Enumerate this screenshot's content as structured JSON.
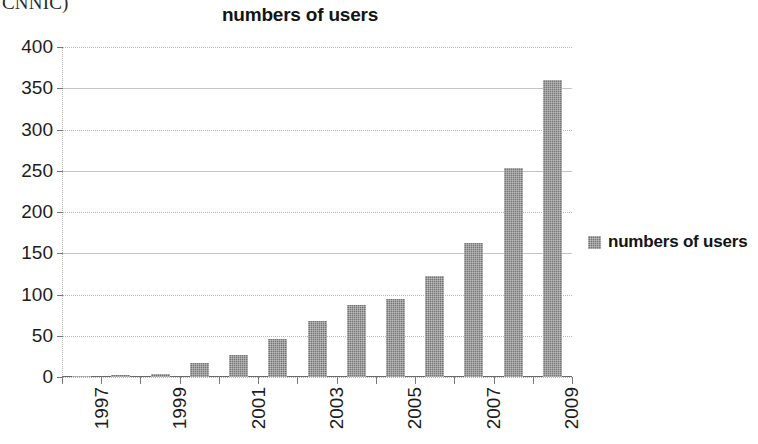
{
  "top_fragment": "CNNIC)",
  "legend": {
    "position": "right",
    "entries": [
      "numbers of users"
    ]
  },
  "colors": {
    "bar": "#757575",
    "gridline": "#b9b9b9",
    "axis": "#6a6a6a",
    "text": "#1d1d1d",
    "background": "#ffffff"
  },
  "chart_data": {
    "type": "bar",
    "title": "numbers of users",
    "xlabel": "",
    "ylabel": "",
    "ylim": [
      0,
      400
    ],
    "yticks": [
      0,
      50,
      100,
      150,
      200,
      250,
      300,
      350,
      400
    ],
    "ytick_labels": [
      "0",
      "50",
      "100",
      "150",
      "200",
      "250",
      "300",
      "350",
      "400"
    ],
    "grid": true,
    "legend_position": "right",
    "categories": [
      "1997",
      "1998",
      "1999",
      "2000",
      "2001",
      "2002",
      "2003",
      "2004",
      "2005",
      "2006",
      "2007",
      "2008",
      "2009"
    ],
    "xtick_labels_shown": [
      "1997",
      "1999",
      "2001",
      "2003",
      "2005",
      "2007",
      "2009"
    ],
    "series": [
      {
        "name": "numbers of users",
        "values": [
          0.6,
          2.1,
          4,
          17,
          27,
          46,
          68,
          87,
          94,
          123,
          162,
          253,
          360
        ]
      }
    ]
  }
}
